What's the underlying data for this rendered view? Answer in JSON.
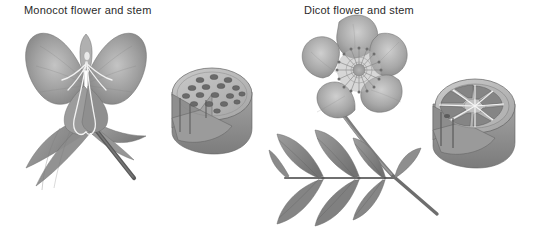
{
  "figure": {
    "title_visible": false,
    "background_color": "#ffffff",
    "render_style": "grayscale halftone textbook illustration",
    "panels": [
      {
        "id": "monocot",
        "label": "Monocot flower and stem",
        "label_color": "#2a2a2a",
        "parts": [
          {
            "name": "flower",
            "description": "broad spreading petals with long pendulous stamens and style"
          },
          {
            "name": "leaves",
            "description": "long strap-like leaves with parallel venation"
          },
          {
            "name": "stem",
            "description": "slender dark stem angled to lower right"
          },
          {
            "name": "stem-cross-section",
            "description": "cylinder with wedge cutaway showing scattered vascular bundles",
            "bundle_count": 17,
            "bundle_arrangement": "scattered"
          }
        ]
      },
      {
        "id": "dicot",
        "label": "Dicot flower and stem",
        "label_color": "#2a2a2a",
        "parts": [
          {
            "name": "flower",
            "description": "five broad rounded petals with dense radiating stamens",
            "petal_count": 5
          },
          {
            "name": "leaf",
            "description": "pinnately compound leaf with serrated leaflets in opposite pairs",
            "leaflet_count": 7
          },
          {
            "name": "stem",
            "description": "straight stem running from flower down through leaf"
          },
          {
            "name": "stem-cross-section",
            "description": "cylinder with wedge cutaway showing vascular bundles in a ring with radiating rays",
            "bundle_count": 11,
            "bundle_arrangement": "ring"
          }
        ]
      }
    ]
  },
  "palette": {
    "background": "#ffffff",
    "text": "#2a2a2a",
    "petal_light": "#bdbdbd",
    "petal_mid": "#9a9a9a",
    "petal_dark": "#7d7d7d",
    "leaf_mid": "#8e8e8e",
    "leaf_dark": "#6f6f6f",
    "stem_dark": "#5a5a5a",
    "section_top": "#b8b8b8",
    "section_face": "#9d9d9d",
    "section_side": "#8a8a8a",
    "bundle": "#6a6a6a",
    "outline": "#5e5e5e"
  }
}
